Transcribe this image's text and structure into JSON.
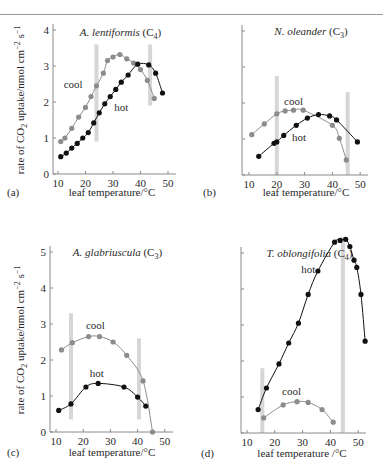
{
  "figure": {
    "top_rule": true,
    "colors": {
      "cool": "#8c8c8c",
      "hot": "#111111",
      "bar": "#d6d6d6",
      "axis": "#8a8a8a",
      "text": "#2a2a2a"
    }
  },
  "chart_data": [
    {
      "panel": "(a)",
      "type": "line",
      "title": "A. lentiformis (C4)",
      "title_species": "A. lentiformis",
      "title_pathway": "C",
      "title_sub": "4",
      "xlabel": "leaf temperature/°C",
      "ylabel": "rate of CO2 uptake/nmol cm^-2 s^-1",
      "xlim": [
        8,
        53
      ],
      "ylim": [
        0,
        4
      ],
      "xticks": [
        10,
        20,
        30,
        40,
        50
      ],
      "yticks": [
        0,
        1,
        2,
        3,
        4
      ],
      "ytick_labels_shown": true,
      "grid": false,
      "legend": "inline labels",
      "vertical_bars": [
        24,
        43.5
      ],
      "bar_ranges": [
        [
          0.9,
          3.6
        ],
        [
          1.9,
          3.6
        ]
      ],
      "series": [
        {
          "name": "cool",
          "label_pos": [
            15.5,
            2.4
          ],
          "x": [
            11,
            12.5,
            15,
            17.5,
            20,
            22,
            24,
            26.5,
            28,
            30,
            32.5,
            35,
            37.5,
            40,
            42.5,
            45
          ],
          "y": [
            0.9,
            1.0,
            1.27,
            1.58,
            1.85,
            2.15,
            2.45,
            2.8,
            3.15,
            3.25,
            3.32,
            3.2,
            3.08,
            2.9,
            2.6,
            2.1
          ]
        },
        {
          "name": "hot",
          "label_pos": [
            33,
            1.75
          ],
          "x": [
            11,
            13,
            15,
            17,
            19,
            21,
            23,
            25,
            27,
            29,
            31,
            33,
            35.5,
            39,
            43,
            45.5,
            48
          ],
          "y": [
            0.48,
            0.58,
            0.72,
            0.85,
            1.0,
            1.15,
            1.42,
            1.7,
            1.95,
            2.15,
            2.35,
            2.55,
            2.75,
            3.05,
            3.03,
            2.8,
            2.25
          ]
        }
      ]
    },
    {
      "panel": "(b)",
      "type": "line",
      "title": "N. oleander (C3)",
      "title_species": "N. oleander",
      "title_pathway": "C",
      "title_sub": "3",
      "xlabel": "leaf temperature/°C",
      "ylabel": "",
      "xlim": [
        8,
        53
      ],
      "ylim": [
        0,
        4
      ],
      "xticks": [
        10,
        20,
        30,
        40,
        50
      ],
      "yticks": [
        0,
        1,
        2,
        3,
        4
      ],
      "ytick_labels_shown": false,
      "grid": false,
      "legend": "inline labels",
      "vertical_bars": [
        20,
        45.5
      ],
      "bar_ranges": [
        [
          0,
          2.75
        ],
        [
          0,
          2.3
        ]
      ],
      "series": [
        {
          "name": "cool",
          "label_pos": [
            26,
            1.95
          ],
          "x": [
            11,
            15.5,
            20,
            23,
            26,
            29.5,
            40,
            42.5,
            45
          ],
          "y": [
            1.12,
            1.42,
            1.7,
            1.78,
            1.8,
            1.8,
            1.38,
            1.02,
            0.42
          ]
        },
        {
          "name": "hot",
          "label_pos": [
            28,
            0.95
          ],
          "x": [
            13.5,
            19,
            20,
            22.5,
            27,
            31,
            35,
            39,
            41.5,
            49
          ],
          "y": [
            0.52,
            0.88,
            0.92,
            1.1,
            1.38,
            1.58,
            1.68,
            1.64,
            1.53,
            0.92
          ]
        }
      ]
    },
    {
      "panel": "(c)",
      "type": "line",
      "title": "A. glabriuscula (C3)",
      "title_species": "A. glabriuscula",
      "title_pathway": "C",
      "title_sub": "3",
      "xlabel": "leaf temperature/°C",
      "ylabel": "rate of CO2 uptake/nmol cm^-2 s^-1",
      "xlim": [
        8,
        53
      ],
      "ylim": [
        0,
        5
      ],
      "xticks": [
        10,
        20,
        30,
        40,
        50
      ],
      "yticks": [
        0,
        1,
        2,
        3,
        4,
        5
      ],
      "ytick_labels_shown": true,
      "grid": false,
      "legend": "inline labels",
      "vertical_bars": [
        15.5,
        40.5
      ],
      "bar_ranges": [
        [
          0.35,
          3.3
        ],
        [
          0.35,
          2.6
        ]
      ],
      "series": [
        {
          "name": "cool",
          "label_pos": [
            24.5,
            2.85
          ],
          "x": [
            12,
            16,
            22,
            26,
            31,
            36,
            42,
            45.5
          ],
          "y": [
            2.28,
            2.48,
            2.65,
            2.65,
            2.5,
            2.13,
            1.42,
            0.0
          ]
        },
        {
          "name": "hot",
          "label_pos": [
            25,
            1.52
          ],
          "x": [
            11,
            15.5,
            21,
            25.5,
            35,
            40,
            43
          ],
          "y": [
            0.6,
            0.78,
            1.25,
            1.35,
            1.25,
            0.97,
            0.72
          ]
        }
      ]
    },
    {
      "panel": "(d)",
      "type": "line",
      "title": "T. oblongifolia (C4)",
      "title_species": "T. oblongifolia",
      "title_pathway": "C",
      "title_sub": "4",
      "xlabel": "leaf temperature /°C",
      "ylabel": "",
      "xlim": [
        8,
        53
      ],
      "ylim": [
        0,
        5
      ],
      "xticks": [
        10,
        20,
        30,
        40,
        50
      ],
      "yticks": [
        0,
        1,
        2,
        3,
        4,
        5
      ],
      "ytick_labels_shown": false,
      "grid": false,
      "legend": "inline labels",
      "vertical_bars": [
        15.5,
        44.5
      ],
      "bar_ranges": [
        [
          0,
          1.8
        ],
        [
          0,
          5.45
        ]
      ],
      "series": [
        {
          "name": "hot",
          "label_pos": [
            32,
            4.45
          ],
          "x": [
            14,
            17,
            21.5,
            25,
            28.5,
            32,
            35.5,
            41.5,
            43.5,
            45.5,
            47,
            48.5,
            49.5,
            51,
            52.5
          ],
          "y": [
            0.65,
            1.25,
            1.92,
            2.5,
            3.05,
            3.85,
            4.5,
            5.3,
            5.35,
            5.38,
            5.18,
            4.8,
            4.6,
            3.85,
            2.55
          ]
        },
        {
          "name": "cool",
          "label_pos": [
            26,
            1.05
          ],
          "x": [
            16,
            23,
            28,
            32,
            37,
            41
          ],
          "y": [
            0.42,
            0.78,
            0.87,
            0.85,
            0.65,
            0.3
          ]
        }
      ]
    }
  ]
}
